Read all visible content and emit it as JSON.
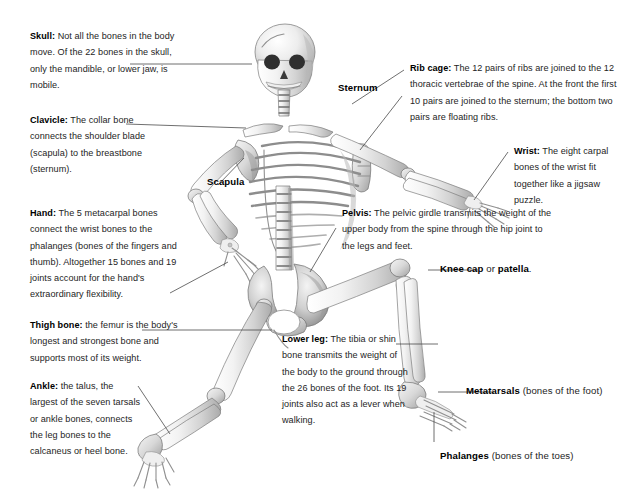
{
  "diagram": {
    "background_color": "#ffffff",
    "text_color": "#242424",
    "leader_line_color": "#4a4a4a"
  },
  "callouts": [
    {
      "id": "skull",
      "term": "Skull:",
      "text": " Not all the bones in the body move. Of the 22 bones in the skull, only the mandible, or lower jaw, is mobile."
    },
    {
      "id": "clavicle",
      "term": "Clavicle:",
      "text": " The collar bone connects the shoulder blade (scapula) to the breastbone (sternum)."
    },
    {
      "id": "hand",
      "term": "Hand:",
      "text": " The 5 metacarpal bones connect the wrist bones to the phalanges (bones of the fingers and thumb). Altogether 15 bones and 19 joints account for the hand's extraordinary flexibility."
    },
    {
      "id": "thigh-bone",
      "term": "Thigh bone:",
      "text": " the femur is the body's longest and strongest bone and supports most of its weight."
    },
    {
      "id": "ankle",
      "term": "Ankle:",
      "text": " the talus, the largest of the seven tarsals or ankle bones, connects the leg bones to the calcaneus or heel bone."
    },
    {
      "id": "rib-cage",
      "term": "Rib cage:",
      "text": " The 12 pairs of ribs are joined to the 12 thoracic vertebrae of the spine. At the front the first 10 pairs are joined to the sternum; the bottom two pairs are floating ribs."
    },
    {
      "id": "wrist",
      "term": "Wrist:",
      "text": " The eight carpal bones of the wrist fit together like a jigsaw puzzle."
    },
    {
      "id": "pelvis",
      "term": "Pelvis:",
      "text": " The pelvic girdle transmits the weight of the upper body from the spine through the hip joint to the legs and feet."
    },
    {
      "id": "lower-leg",
      "term": "Lower leg:",
      "text": " The tibia or shin bone transmits the weight of the body to the ground through the 26 bones of the foot. Its 19 joints also act as a lever when walking."
    }
  ],
  "tags": {
    "sternum": {
      "label": "Sternum"
    },
    "scapula": {
      "label": "Scapula"
    },
    "knee_cap": {
      "label": "Knee cap",
      "connector": " or ",
      "alt": "patella",
      "suffix": "."
    },
    "metatarsals": {
      "label": "Metatarsals",
      "note": " (bones of the foot)"
    },
    "phalanges": {
      "label": "Phalanges",
      "note": " (bones of the toes)"
    }
  }
}
